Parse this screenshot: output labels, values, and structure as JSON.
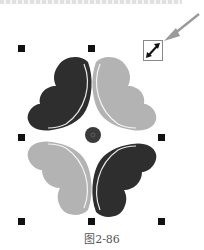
{
  "caption": "图2-86",
  "colors": {
    "dark_petal": "#2e2e2e",
    "light_petal": "#b3b3b3",
    "handle": "#111111",
    "arrow": "#9a9a9a",
    "center_dot": "#3a3a3a"
  },
  "selection": {
    "handles": [
      {
        "id": "top-left",
        "x": 18,
        "y": 45
      },
      {
        "id": "top-center",
        "x": 88,
        "y": 45
      },
      {
        "id": "middle-left",
        "x": 18,
        "y": 134
      },
      {
        "id": "middle-right",
        "x": 158,
        "y": 134
      },
      {
        "id": "bottom-left",
        "x": 18,
        "y": 218
      },
      {
        "id": "bottom-center",
        "x": 88,
        "y": 218
      },
      {
        "id": "bottom-right",
        "x": 158,
        "y": 218
      }
    ],
    "scale_icon": "diagonal-resize-icon"
  },
  "annotation": {
    "pointer": "arrow-pointer-icon"
  }
}
